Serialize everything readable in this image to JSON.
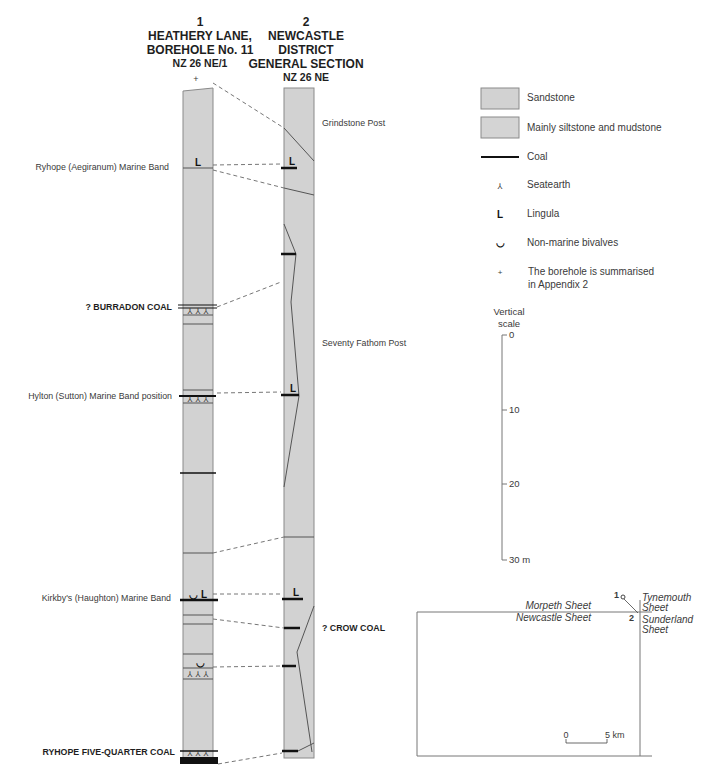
{
  "page_header": "",
  "columns": [
    {
      "number": "1",
      "title_lines": [
        "HEATHERY LANE,",
        "BOREHOLE No. 11"
      ],
      "grid_ref": "NZ 26 NE/1",
      "note_marker": "+"
    },
    {
      "number": "2",
      "title_lines": [
        "NEWCASTLE",
        "DISTRICT",
        "GENERAL SECTION"
      ],
      "grid_ref": "NZ 26 NE"
    }
  ],
  "left_labels": {
    "ryhope_marine_band": "Ryhope (Aegiranum) Marine Band",
    "burradon_coal": "? BURRADON COAL",
    "hylton_marine_band": "Hylton (Sutton) Marine Band position",
    "kirkby_marine_band": "Kirkby's (Haughton) Marine Band",
    "ryhope_five_quarter_coal": "RYHOPE FIVE-QUARTER COAL"
  },
  "right_labels": {
    "grindstone_post": "Grindstone Post",
    "seventy_fathom_post": "Seventy Fathom Post",
    "crow_coal": "? CROW COAL"
  },
  "symbols": {
    "lingula": "L",
    "seatearth": "⅄",
    "bivalve": "◡",
    "borehole_note": "+"
  },
  "legend": {
    "items": [
      {
        "symbol": "sandstone-swatch",
        "label": "Sandstone"
      },
      {
        "symbol": "siltstone-swatch",
        "label": "Mainly siltstone and mudstone"
      },
      {
        "symbol": "coal-line",
        "label": "Coal"
      },
      {
        "symbol": "⅄",
        "label": "Seatearth"
      },
      {
        "symbol": "L",
        "label": "Lingula"
      },
      {
        "symbol": "◡",
        "label": "Non-marine bivalves"
      },
      {
        "symbol": "+",
        "label": "The borehole is summarised",
        "label2": "in Appendix 2"
      }
    ]
  },
  "vertical_scale": {
    "title_lines": [
      "Vertical",
      "scale"
    ],
    "ticks": [
      "0",
      "10",
      "20",
      "30 m"
    ]
  },
  "location_map": {
    "north_left": "Morpeth Sheet",
    "south_left": "Newcastle Sheet",
    "north_right_lines": [
      "Tynemouth",
      "Sheet"
    ],
    "south_right_lines": [
      "Sunderland",
      "Sheet"
    ],
    "point_1": "1",
    "point_2": "2",
    "scale_start": "0",
    "scale_end": "5 km"
  },
  "colors": {
    "column_fill": "#d2d2d2",
    "column_stroke": "#8a8a8a",
    "coal": "#111111"
  }
}
